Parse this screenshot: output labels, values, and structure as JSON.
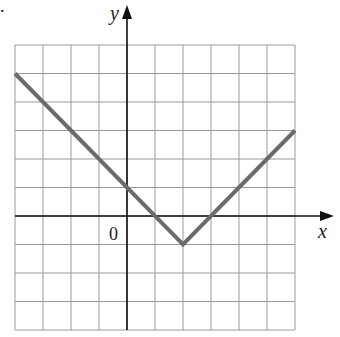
{
  "chart_data": {
    "type": "line",
    "title": "",
    "xlabel": "x",
    "ylabel": "y",
    "origin_label": "0",
    "xlim": [
      -4,
      6
    ],
    "ylim": [
      -4,
      6
    ],
    "grid": true,
    "grid_step": 1,
    "series": [
      {
        "name": "y = |x - 2| - 1",
        "color": "#6b6b6b",
        "x": [
          -4,
          2,
          6
        ],
        "y": [
          5,
          -1,
          3
        ]
      }
    ],
    "key_points": {
      "start": [
        -4,
        5
      ],
      "vertex": [
        2,
        -1
      ],
      "end": [
        6,
        3
      ],
      "y_intercept": [
        0,
        1
      ],
      "x_intercepts": [
        [
          1,
          0
        ],
        [
          3,
          0
        ]
      ]
    }
  },
  "marker": "."
}
